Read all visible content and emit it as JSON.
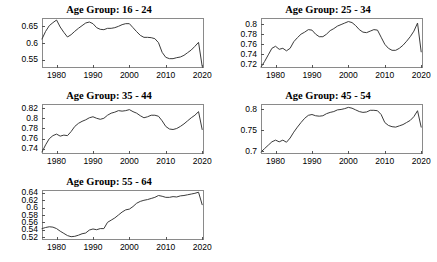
{
  "figure": {
    "background": "#ffffff",
    "line_color": "#3b3b3b",
    "axis_color": "#8a8a8a"
  },
  "panels": [
    {
      "id": "age-16-24",
      "title": "Age Group: 16 -  24",
      "ytick_labels": [
        "0.55",
        "0.6",
        "0.65"
      ],
      "xtick_labels": [
        "1980",
        "1990",
        "2000",
        "2010",
        "2020"
      ]
    },
    {
      "id": "age-25-34",
      "title": "Age Group: 25 -  34",
      "ytick_labels": [
        "0.72",
        "0.74",
        "0.76",
        "0.78",
        "0.8"
      ],
      "xtick_labels": [
        "1980",
        "1990",
        "2000",
        "2010",
        "2020"
      ]
    },
    {
      "id": "age-35-44",
      "title": "Age Group: 35 -  44",
      "ytick_labels": [
        "0.74",
        "0.76",
        "0.78",
        "0.8",
        "0.82"
      ],
      "xtick_labels": [
        "1980",
        "1990",
        "2000",
        "2010",
        "2020"
      ]
    },
    {
      "id": "age-45-54",
      "title": "Age Group: 45 -  54",
      "ytick_labels": [
        "0.7",
        "0.75",
        "0.8"
      ],
      "xtick_labels": [
        "1980",
        "1990",
        "2000",
        "2010",
        "2020"
      ]
    },
    {
      "id": "age-55-64",
      "title": "Age Group: 55 -  64",
      "ytick_labels": [
        "0.52",
        "0.54",
        "0.56",
        "0.58",
        "0.6",
        "0.62",
        "0.64"
      ],
      "xtick_labels": [
        "1980",
        "1990",
        "2000",
        "2010",
        "2020"
      ]
    }
  ],
  "chart_data": [
    {
      "type": "line",
      "title": "Age Group: 16 -  24",
      "xlabel": "",
      "ylabel": "",
      "xlim": [
        1976,
        2020.5
      ],
      "ylim": [
        0.525,
        0.675
      ],
      "yticks": [
        0.55,
        0.6,
        0.65
      ],
      "xticks": [
        1980,
        1990,
        2000,
        2010,
        2020
      ],
      "grid": false,
      "legend": "none",
      "x": [
        1976,
        1977,
        1978,
        1979,
        1980,
        1981,
        1982,
        1983,
        1984,
        1985,
        1986,
        1987,
        1988,
        1989,
        1990,
        1991,
        1992,
        1993,
        1994,
        1995,
        1996,
        1997,
        1998,
        1999,
        2000,
        2001,
        2002,
        2003,
        2004,
        2005,
        2006,
        2007,
        2008,
        2009,
        2010,
        2011,
        2012,
        2013,
        2014,
        2015,
        2016,
        2017,
        2018,
        2019,
        2020
      ],
      "values": [
        0.612,
        0.635,
        0.652,
        0.661,
        0.669,
        0.648,
        0.632,
        0.618,
        0.625,
        0.635,
        0.644,
        0.652,
        0.66,
        0.663,
        0.658,
        0.646,
        0.641,
        0.64,
        0.644,
        0.644,
        0.646,
        0.65,
        0.655,
        0.658,
        0.658,
        0.646,
        0.634,
        0.623,
        0.617,
        0.617,
        0.616,
        0.613,
        0.601,
        0.572,
        0.557,
        0.553,
        0.553,
        0.556,
        0.558,
        0.563,
        0.571,
        0.579,
        0.59,
        0.602,
        0.53
      ]
    },
    {
      "type": "line",
      "title": "Age Group: 25 -  34",
      "xlabel": "",
      "ylabel": "",
      "xlim": [
        1976,
        2020.5
      ],
      "ylim": [
        0.713,
        0.812
      ],
      "yticks": [
        0.72,
        0.74,
        0.76,
        0.78,
        0.8
      ],
      "xticks": [
        1980,
        1990,
        2000,
        2010,
        2020
      ],
      "grid": false,
      "legend": "none",
      "x": [
        1976,
        1977,
        1978,
        1979,
        1980,
        1981,
        1982,
        1983,
        1984,
        1985,
        1986,
        1987,
        1988,
        1989,
        1990,
        1991,
        1992,
        1993,
        1994,
        1995,
        1996,
        1997,
        1998,
        1999,
        2000,
        2001,
        2002,
        2003,
        2004,
        2005,
        2006,
        2007,
        2008,
        2009,
        2010,
        2011,
        2012,
        2013,
        2014,
        2015,
        2016,
        2017,
        2018,
        2019,
        2020
      ],
      "values": [
        0.715,
        0.726,
        0.739,
        0.752,
        0.756,
        0.75,
        0.752,
        0.747,
        0.752,
        0.765,
        0.773,
        0.78,
        0.784,
        0.789,
        0.788,
        0.78,
        0.775,
        0.775,
        0.78,
        0.787,
        0.791,
        0.796,
        0.799,
        0.802,
        0.805,
        0.803,
        0.797,
        0.789,
        0.784,
        0.783,
        0.786,
        0.789,
        0.788,
        0.774,
        0.76,
        0.752,
        0.748,
        0.748,
        0.752,
        0.758,
        0.766,
        0.775,
        0.786,
        0.802,
        0.745
      ]
    },
    {
      "type": "line",
      "title": "Age Group: 35 -  44",
      "xlabel": "",
      "ylabel": "",
      "xlim": [
        1976,
        2020.5
      ],
      "ylim": [
        0.73,
        0.828
      ],
      "yticks": [
        0.74,
        0.76,
        0.78,
        0.8,
        0.82
      ],
      "xticks": [
        1980,
        1990,
        2000,
        2010,
        2020
      ],
      "grid": false,
      "legend": "none",
      "x": [
        1976,
        1977,
        1978,
        1979,
        1980,
        1981,
        1982,
        1983,
        1984,
        1985,
        1986,
        1987,
        1988,
        1989,
        1990,
        1991,
        1992,
        1993,
        1994,
        1995,
        1996,
        1997,
        1998,
        1999,
        2000,
        2001,
        2002,
        2003,
        2004,
        2005,
        2006,
        2007,
        2008,
        2009,
        2010,
        2011,
        2012,
        2013,
        2014,
        2015,
        2016,
        2017,
        2018,
        2019,
        2020
      ],
      "values": [
        0.734,
        0.748,
        0.76,
        0.766,
        0.769,
        0.765,
        0.767,
        0.766,
        0.774,
        0.784,
        0.79,
        0.794,
        0.797,
        0.801,
        0.803,
        0.8,
        0.798,
        0.8,
        0.806,
        0.81,
        0.812,
        0.815,
        0.814,
        0.815,
        0.817,
        0.813,
        0.81,
        0.805,
        0.801,
        0.803,
        0.806,
        0.806,
        0.804,
        0.795,
        0.784,
        0.779,
        0.778,
        0.78,
        0.784,
        0.789,
        0.795,
        0.801,
        0.806,
        0.813,
        0.778
      ]
    },
    {
      "type": "line",
      "title": "Age Group: 45 -  54",
      "xlabel": "",
      "ylabel": "",
      "xlim": [
        1976,
        2020.5
      ],
      "ylim": [
        0.693,
        0.812
      ],
      "yticks": [
        0.7,
        0.75,
        0.8
      ],
      "xticks": [
        1980,
        1990,
        2000,
        2010,
        2020
      ],
      "grid": false,
      "legend": "none",
      "x": [
        1976,
        1977,
        1978,
        1979,
        1980,
        1981,
        1982,
        1983,
        1984,
        1985,
        1986,
        1987,
        1988,
        1989,
        1990,
        1991,
        1992,
        1993,
        1994,
        1995,
        1996,
        1997,
        1998,
        1999,
        2000,
        2001,
        2002,
        2003,
        2004,
        2005,
        2006,
        2007,
        2008,
        2009,
        2010,
        2011,
        2012,
        2013,
        2014,
        2015,
        2016,
        2017,
        2018,
        2019,
        2020
      ],
      "values": [
        0.698,
        0.706,
        0.714,
        0.722,
        0.726,
        0.722,
        0.726,
        0.721,
        0.731,
        0.745,
        0.757,
        0.768,
        0.778,
        0.785,
        0.787,
        0.784,
        0.783,
        0.784,
        0.789,
        0.792,
        0.794,
        0.798,
        0.799,
        0.801,
        0.804,
        0.802,
        0.798,
        0.794,
        0.792,
        0.793,
        0.797,
        0.797,
        0.796,
        0.787,
        0.768,
        0.761,
        0.758,
        0.757,
        0.76,
        0.763,
        0.768,
        0.773,
        0.782,
        0.796,
        0.757
      ]
    },
    {
      "type": "line",
      "title": "Age Group: 55 -  64",
      "xlabel": "",
      "ylabel": "",
      "xlim": [
        1976,
        2020.5
      ],
      "ylim": [
        0.512,
        0.648
      ],
      "yticks": [
        0.52,
        0.54,
        0.56,
        0.58,
        0.6,
        0.62,
        0.64
      ],
      "xticks": [
        1980,
        1990,
        2000,
        2010,
        2020
      ],
      "grid": false,
      "legend": "none",
      "x": [
        1976,
        1977,
        1978,
        1979,
        1980,
        1981,
        1982,
        1983,
        1984,
        1985,
        1986,
        1987,
        1988,
        1989,
        1990,
        1991,
        1992,
        1993,
        1994,
        1995,
        1996,
        1997,
        1998,
        1999,
        2000,
        2001,
        2002,
        2003,
        2004,
        2005,
        2006,
        2007,
        2008,
        2009,
        2010,
        2011,
        2012,
        2013,
        2014,
        2015,
        2016,
        2017,
        2018,
        2019,
        2020
      ],
      "values": [
        0.543,
        0.546,
        0.548,
        0.547,
        0.543,
        0.536,
        0.53,
        0.524,
        0.521,
        0.522,
        0.525,
        0.529,
        0.531,
        0.539,
        0.542,
        0.54,
        0.543,
        0.543,
        0.56,
        0.566,
        0.572,
        0.58,
        0.588,
        0.594,
        0.596,
        0.603,
        0.612,
        0.617,
        0.62,
        0.622,
        0.625,
        0.628,
        0.633,
        0.631,
        0.628,
        0.628,
        0.63,
        0.629,
        0.632,
        0.633,
        0.635,
        0.637,
        0.639,
        0.642,
        0.608
      ]
    }
  ]
}
